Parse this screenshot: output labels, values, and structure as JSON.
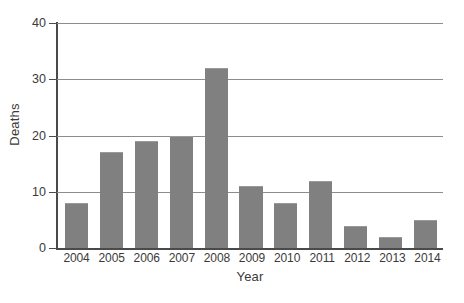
{
  "chart_data": {
    "type": "bar",
    "title": "",
    "xlabel": "Year",
    "ylabel": "Deaths",
    "categories": [
      "2004",
      "2005",
      "2006",
      "2007",
      "2008",
      "2009",
      "2010",
      "2011",
      "2012",
      "2013",
      "2014"
    ],
    "values": [
      8,
      17,
      19,
      20,
      32,
      11,
      8,
      12,
      4,
      2,
      5
    ],
    "ylim": [
      0,
      40
    ],
    "yticks": [
      0,
      10,
      20,
      30,
      40
    ],
    "ytick_labels": [
      "0",
      "10",
      "20",
      "30",
      "40"
    ],
    "grid": true,
    "legend": false,
    "bar_color": "#808080",
    "axis_color": "#4a4a4a",
    "gridline_color": "#8c8c8c",
    "background": "#ffffff"
  }
}
